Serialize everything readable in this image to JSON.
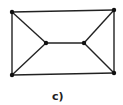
{
  "diagram": {
    "type": "graph",
    "caption": "c)",
    "nodes": [
      {
        "id": "tl",
        "x": 12,
        "y": 12
      },
      {
        "id": "tr",
        "x": 114,
        "y": 10
      },
      {
        "id": "bl",
        "x": 12,
        "y": 75
      },
      {
        "id": "br",
        "x": 114,
        "y": 73
      },
      {
        "id": "il",
        "x": 46,
        "y": 43
      },
      {
        "id": "ir",
        "x": 84,
        "y": 43
      }
    ],
    "edges": [
      [
        "tl",
        "tr"
      ],
      [
        "bl",
        "br"
      ],
      [
        "tl",
        "bl"
      ],
      [
        "tr",
        "br"
      ],
      [
        "tl",
        "il"
      ],
      [
        "bl",
        "il"
      ],
      [
        "il",
        "ir"
      ],
      [
        "tr",
        "ir"
      ],
      [
        "br",
        "ir"
      ]
    ],
    "colors": {
      "stroke": "#222222",
      "node": "#111111"
    }
  }
}
